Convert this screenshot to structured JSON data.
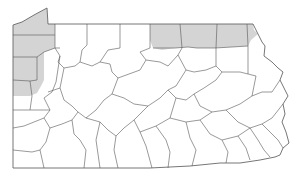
{
  "map": {
    "subject": "Pennsylvania county map",
    "shaded_regions": [
      {
        "name": "northwest-strip",
        "description": "Western border counties (Erie, Crawford, Mercer, Lawrence area)"
      },
      {
        "name": "northern-tier",
        "description": "Northern border counties (McKean/Potter, Tioga, Bradford, Susquehanna area)"
      }
    ],
    "colors": {
      "shade": "#d4d4d4",
      "border": "#555555",
      "background": "#ffffff"
    }
  }
}
